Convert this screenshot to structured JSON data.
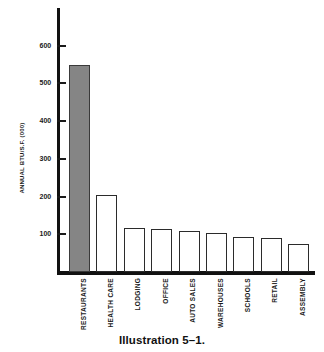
{
  "chart_data": {
    "type": "bar",
    "title": "",
    "xlabel": "",
    "ylabel": "ANNUAL BTU/S.F. (000)",
    "categories": [
      "RESTAURANTS",
      "HEALTH CARE",
      "LODGING",
      "OFFICE",
      "AUTO SALES",
      "WAREHOUSES",
      "SCHOOLS",
      "RETAIL",
      "ASSEMBLY"
    ],
    "values": [
      550,
      205,
      118,
      113,
      108,
      103,
      93,
      89,
      75
    ],
    "ylim": [
      0,
      700
    ],
    "yticks": [
      100,
      200,
      300,
      400,
      500,
      600
    ],
    "ytick_labels": [
      "100",
      "200",
      "300",
      "400",
      "500",
      "600"
    ],
    "grid": false,
    "legend": null,
    "highlight_index": 0,
    "colors": {
      "highlight_fill": "#858585",
      "bar_fill": "#ffffff",
      "bar_stroke": "#2b2b2b",
      "axis": "#111111",
      "text": "#1a1a1a"
    }
  },
  "caption": {
    "text": "Illustration 5–1."
  }
}
